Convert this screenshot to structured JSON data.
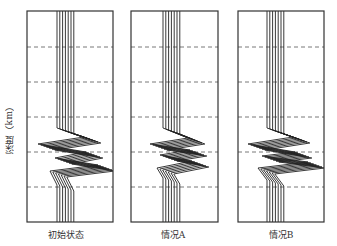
{
  "figure": {
    "ylabel": "深度（km）",
    "dashed_grid_y": [
      47,
      82,
      117,
      152,
      187
    ],
    "panels": [
      {
        "label": "初始状态",
        "box": {
          "x": 27,
          "y": 11,
          "w": 86,
          "h": 211
        },
        "base_x": 57,
        "path": [
          [
            57,
            11
          ],
          [
            57,
            128
          ],
          [
            84,
            137
          ],
          [
            38,
            144
          ],
          [
            86,
            152
          ],
          [
            55,
            158
          ],
          [
            98,
            165
          ],
          [
            50,
            171
          ],
          [
            57,
            185
          ],
          [
            57,
            222
          ]
        ]
      },
      {
        "label": "情况A",
        "box": {
          "x": 131,
          "y": 11,
          "w": 87,
          "h": 211
        },
        "base_x": 163,
        "path": [
          [
            163,
            11
          ],
          [
            163,
            128
          ],
          [
            188,
            138
          ],
          [
            150,
            144
          ],
          [
            190,
            150
          ],
          [
            160,
            155
          ],
          [
            192,
            161
          ],
          [
            157,
            168
          ],
          [
            163,
            178
          ],
          [
            163,
            222
          ]
        ]
      },
      {
        "label": "情况B",
        "box": {
          "x": 238,
          "y": 11,
          "w": 86,
          "h": 211
        },
        "base_x": 267,
        "path": [
          [
            267,
            11
          ],
          [
            267,
            128
          ],
          [
            293,
            137
          ],
          [
            248,
            144
          ],
          [
            295,
            152
          ],
          [
            262,
            156
          ],
          [
            308,
            162
          ],
          [
            258,
            168
          ],
          [
            267,
            180
          ],
          [
            267,
            222
          ]
        ]
      }
    ],
    "trace_count": 7,
    "trace_spacing": 2.8,
    "colors": {
      "frame": "#333333",
      "grid": "#555555",
      "trace": "#222222"
    }
  }
}
